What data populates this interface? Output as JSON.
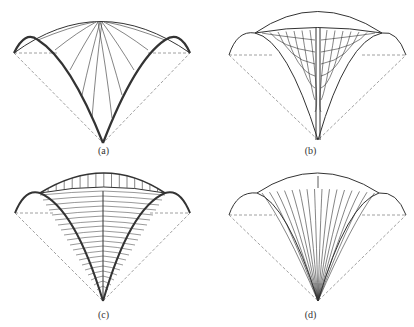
{
  "figure": {
    "panels": [
      {
        "id": "a",
        "caption": "(a)",
        "description": "Groined vault with radial ribs from crown to diagonal arches"
      },
      {
        "id": "b",
        "caption": "(b)",
        "description": "Vault with central vertical rib and curved ribs branching to it"
      },
      {
        "id": "c",
        "caption": "(c)",
        "description": "Vault with central rib and horizontal ribs, arched top with vertical struts"
      },
      {
        "id": "d",
        "caption": "(d)",
        "description": "Fan of arches converging to a single support point"
      }
    ],
    "colors": {
      "line": "#333333",
      "dashed": "#888888",
      "background": "#ffffff"
    }
  }
}
